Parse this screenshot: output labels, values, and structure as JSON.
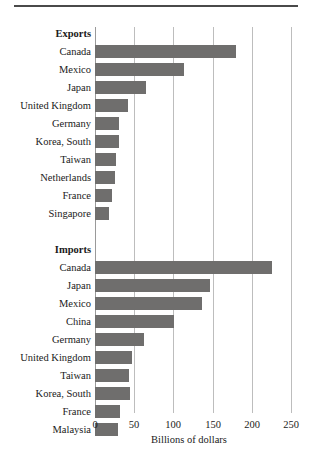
{
  "figure": {
    "x_axis_title": "Billions of dollars",
    "tick_labels": [
      "0",
      "50",
      "100",
      "150",
      "200",
      "250"
    ],
    "group_labels": {
      "exports": "Exports",
      "imports": "Imports"
    },
    "bar_color": "#6f6e6d",
    "grid_color": "#bdbdbd"
  },
  "chart_data": {
    "type": "bar",
    "orientation": "horizontal",
    "title": "",
    "xlabel": "Billions of dollars",
    "ylabel": "",
    "xlim": [
      0,
      250
    ],
    "xticks": [
      0,
      50,
      100,
      150,
      200,
      250
    ],
    "grid": true,
    "legend": "none",
    "panels": [
      {
        "name": "Exports",
        "categories": [
          "Canada",
          "Mexico",
          "Japan",
          "United Kingdom",
          "Germany",
          "Korea, South",
          "Taiwan",
          "Netherlands",
          "France",
          "Singapore"
        ],
        "values": [
          180,
          113,
          65,
          42,
          31,
          31,
          27,
          25,
          22,
          18
        ]
      },
      {
        "name": "Imports",
        "categories": [
          "Canada",
          "Japan",
          "Mexico",
          "China",
          "Germany",
          "United Kingdom",
          "Taiwan",
          "Korea, South",
          "France",
          "Malaysia"
        ],
        "values": [
          226,
          147,
          137,
          101,
          63,
          47,
          44,
          45,
          32,
          29
        ]
      }
    ]
  }
}
